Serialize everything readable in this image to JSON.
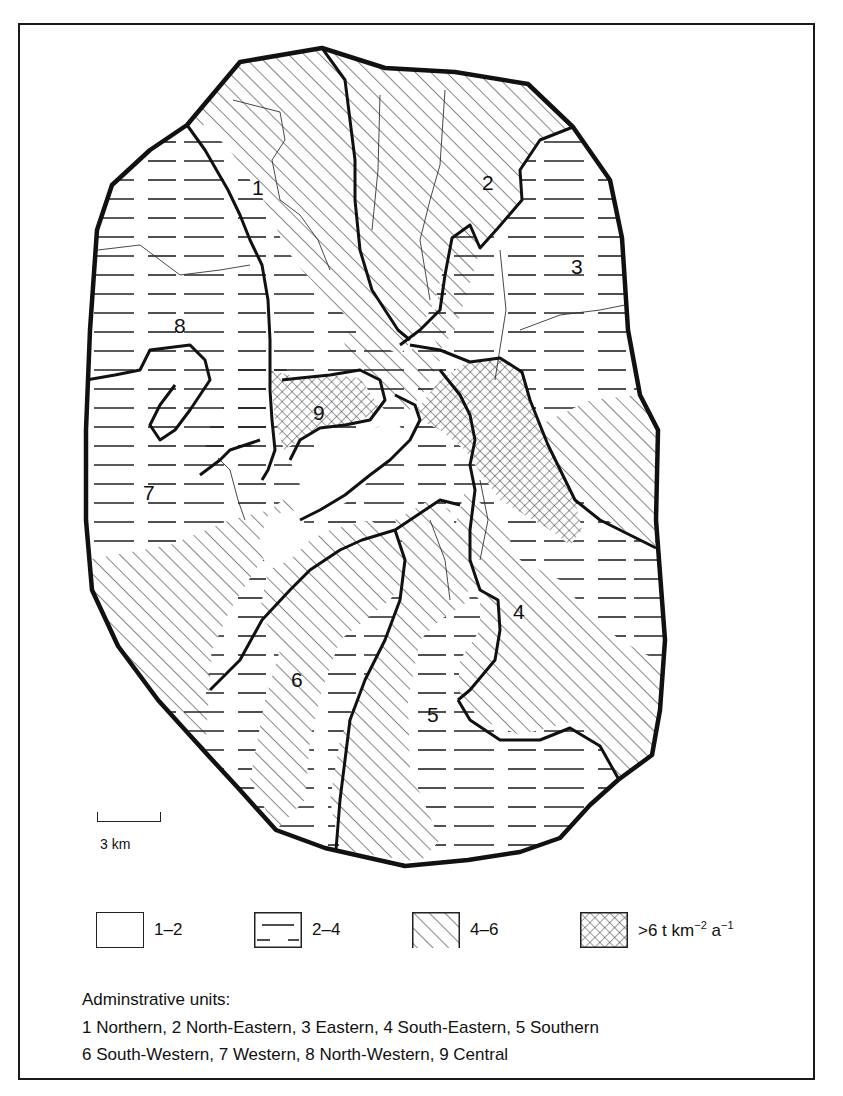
{
  "map": {
    "region_labels": [
      {
        "id": "1",
        "name": "Northern",
        "x": 258,
        "y": 195
      },
      {
        "id": "2",
        "name": "North-Eastern",
        "x": 488,
        "y": 188
      },
      {
        "id": "3",
        "name": "Eastern",
        "x": 577,
        "y": 272
      },
      {
        "id": "4",
        "name": "South-Eastern",
        "x": 519,
        "y": 617
      },
      {
        "id": "5",
        "name": "Southern",
        "x": 433,
        "y": 720
      },
      {
        "id": "6",
        "name": "South-Western",
        "x": 297,
        "y": 685
      },
      {
        "id": "7",
        "name": "Western",
        "x": 146,
        "y": 498
      },
      {
        "id": "8",
        "name": "North-Western",
        "x": 180,
        "y": 331
      },
      {
        "id": "9",
        "name": "Central",
        "x": 320,
        "y": 418
      }
    ],
    "scale_bar": {
      "label": "3 km"
    }
  },
  "legend": {
    "items": [
      {
        "pattern": "blank",
        "label": "1–2"
      },
      {
        "pattern": "horizontal-dashes",
        "label": "2–4"
      },
      {
        "pattern": "diagonal-hatch",
        "label": "4–6"
      },
      {
        "pattern": "cross-hatch",
        "label_prefix": ">6 t km",
        "sup1": "−2",
        "label_mid": " a",
        "sup2": "−1"
      }
    ]
  },
  "units": {
    "title": "Adminstrative units:",
    "line1": "1 Northern, 2 North-Eastern, 3 Eastern, 4 South-Eastern, 5 Southern",
    "line2": "6 South-Western, 7 Western, 8 North-Western, 9 Central"
  }
}
